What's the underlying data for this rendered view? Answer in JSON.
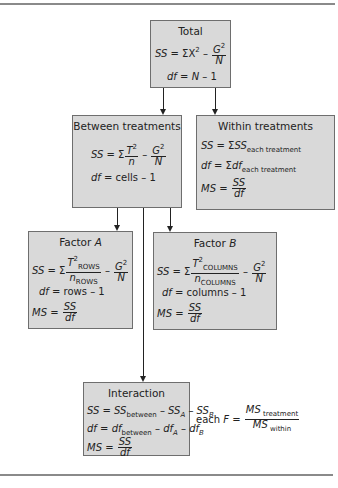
{
  "diagram": {
    "type": "two-factor-anova-flowchart",
    "colors": {
      "box_fill": "#d9d9d9",
      "box_border": "#6e6e6e",
      "rule": "#8a8a8a",
      "text": "#222222"
    },
    "total": {
      "title": "Total",
      "ss_lhs": "SS",
      "ss_eq": " = ΣX",
      "ss_exp": "2",
      "ss_minus": " – ",
      "g": "G",
      "g_exp": "2",
      "n": "N",
      "df_lhs": "df",
      "df_rhs_n": "N",
      "df_rhs_rest": " – 1"
    },
    "between": {
      "title": "Between treatments",
      "ss_lhs": "SS",
      "ss_eq": " = Σ",
      "t": "T",
      "t_exp": "2",
      "n_small": "n",
      "minus": " – ",
      "g": "G",
      "g_exp": "2",
      "n": "N",
      "df_lhs": "df",
      "df_rhs": " = cells – 1"
    },
    "within": {
      "title": "Within treatments",
      "ss_lhs": "SS",
      "ss_eq": " = Σ",
      "ss_term": "SS",
      "ss_sub": "each treatment",
      "df_lhs": "df",
      "df_eq": " = Σ",
      "df_term": "df",
      "df_sub": "each treatment",
      "ms_lhs": "MS",
      "ms_eq": " = ",
      "ms_num": "SS",
      "ms_den": "df"
    },
    "factor_a": {
      "title": "Factor ",
      "title_var": "A",
      "ss_lhs": "SS",
      "ss_eq": " = Σ",
      "t": "T",
      "t_exp": "2",
      "t_sub": "ROWS",
      "n_small": "n",
      "n_sub": "ROWS",
      "minus": " – ",
      "g": "G",
      "g_exp": "2",
      "n": "N",
      "df_lhs": "df",
      "df_rhs": " = rows – 1",
      "ms_lhs": "MS",
      "ms_eq": " = ",
      "ms_num": "SS",
      "ms_den": "df"
    },
    "factor_b": {
      "title": "Factor ",
      "title_var": "B",
      "ss_lhs": "SS",
      "ss_eq": " = Σ",
      "t": "T",
      "t_exp": "2",
      "t_sub": "COLUMNS",
      "n_small": "n",
      "n_sub": "COLUMNS",
      "minus": " – ",
      "g": "G",
      "g_exp": "2",
      "n": "N",
      "df_lhs": "df",
      "df_rhs": " = columns – 1",
      "ms_lhs": "MS",
      "ms_eq": " = ",
      "ms_num": "SS",
      "ms_den": "df"
    },
    "interaction": {
      "title": "Interaction",
      "ss_lhs": "SS",
      "ss_eq": " = ",
      "ss_t1": "SS",
      "ss_t1_sub": "between",
      "ss_m1": " – ",
      "ss_t2": "SS",
      "ss_t2_sub": "A",
      "ss_m2": " – ",
      "ss_t3": "SS",
      "ss_t3_sub": "B",
      "df_lhs": "df",
      "df_eq": " = ",
      "df_t1": "df",
      "df_t1_sub": "between",
      "df_m1": " – ",
      "df_t2": "df",
      "df_t2_sub": "A",
      "df_m2": " – ",
      "df_t3": "df",
      "df_t3_sub": "B",
      "ms_lhs": "MS",
      "ms_eq": " = ",
      "ms_num": "SS",
      "ms_den": "df"
    },
    "f_ratio": {
      "prefix": "each ",
      "f": "F",
      "eq": " = ",
      "num": "MS",
      "num_sub": " treatment",
      "den": "MS",
      "den_sub": " within"
    }
  }
}
